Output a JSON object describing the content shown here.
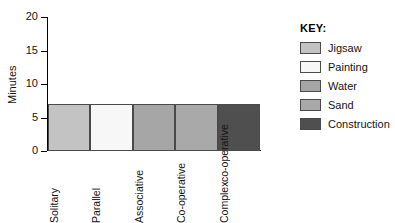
{
  "chart_data": {
    "type": "bar",
    "title": "",
    "xlabel": "",
    "ylabel": "Minutes",
    "categories": [
      "Solitary",
      "Parallel",
      "Associative",
      "Co-operative",
      "Complex co-operative"
    ],
    "category_lines": [
      [
        "Solitary"
      ],
      [
        "Parallel"
      ],
      [
        "Associative"
      ],
      [
        "Co-operative"
      ],
      [
        "Complex",
        "co-operative"
      ]
    ],
    "values": [
      7,
      7,
      7,
      7,
      7
    ],
    "ylim": [
      0,
      20
    ],
    "yticks": [
      0,
      5,
      10,
      15,
      20
    ],
    "ytick_labels": [
      "0",
      "5",
      "10",
      "15",
      "20"
    ],
    "grid": false,
    "legend_position": "right",
    "bar_colors": [
      "#c3c3c3",
      "#f7f7f7",
      "#a6a6a6",
      "#a9a9a9",
      "#4f4f4f"
    ],
    "bar_border_color": "#4a4a4a"
  },
  "legend": {
    "title": "KEY:",
    "items": [
      {
        "label": "Jigsaw",
        "color": "#c3c3c3"
      },
      {
        "label": "Painting",
        "color": "#f7f7f7"
      },
      {
        "label": "Water",
        "color": "#a6a6a6"
      },
      {
        "label": "Sand",
        "color": "#a9a9a9"
      },
      {
        "label": "Construction",
        "color": "#4f4f4f"
      }
    ]
  }
}
